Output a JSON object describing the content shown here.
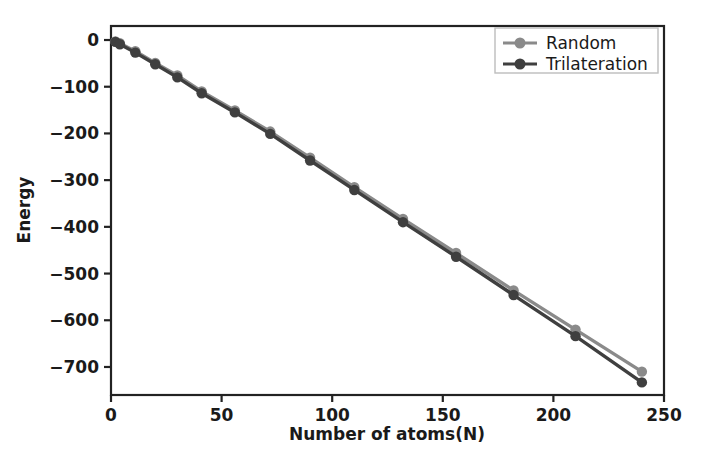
{
  "chart_data": {
    "type": "line",
    "title": "",
    "xlabel": "Number of atoms(N)",
    "ylabel": "Energy",
    "xlim": [
      0,
      250
    ],
    "ylim": [
      -760,
      30
    ],
    "xticks": [
      0,
      50,
      100,
      150,
      200,
      250
    ],
    "yticks": [
      0,
      -100,
      -200,
      -300,
      -400,
      -500,
      -600,
      -700
    ],
    "xtick_labels": [
      "0",
      "50",
      "100",
      "150",
      "200",
      "250"
    ],
    "ytick_labels": [
      "0",
      "−100",
      "−200",
      "−300",
      "−400",
      "−500",
      "−600",
      "−700"
    ],
    "grid": false,
    "legend_position": "upper right",
    "x": [
      2,
      4,
      11,
      20,
      30,
      41,
      56,
      72,
      90,
      110,
      132,
      156,
      182,
      210,
      240
    ],
    "series": [
      {
        "name": "Random",
        "color": "#8a8a8a",
        "marker": "o",
        "values": [
          -3,
          -7,
          -24,
          -49,
          -76,
          -110,
          -151,
          -196,
          -252,
          -315,
          -383,
          -456,
          -536,
          -620,
          -710
        ]
      },
      {
        "name": "Trilateration",
        "color": "#3f3f3f",
        "marker": "o",
        "values": [
          -4,
          -9,
          -27,
          -52,
          -80,
          -114,
          -155,
          -201,
          -258,
          -321,
          -390,
          -464,
          -546,
          -634,
          -733
        ]
      }
    ]
  },
  "legend": {
    "entries": [
      {
        "label": "Random"
      },
      {
        "label": "Trilateration"
      }
    ]
  },
  "axes": {
    "x_title": "Number of atoms(N)",
    "y_title": "Energy"
  },
  "colors": {
    "random": "#8a8a8a",
    "trilateration": "#3f3f3f",
    "axis": "#222222",
    "background": "#ffffff",
    "text": "#1a1a1a"
  }
}
